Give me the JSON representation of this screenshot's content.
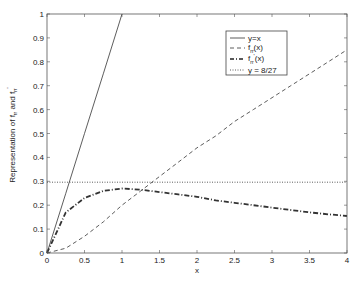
{
  "chart_data": {
    "type": "line",
    "title": "",
    "xlabel": "x",
    "ylabel": "Representation of f_rr and f_rr'",
    "xlim": [
      0,
      4
    ],
    "ylim": [
      0,
      1
    ],
    "xticks": [
      0,
      0.5,
      1,
      1.5,
      2,
      2.5,
      3,
      3.5,
      4
    ],
    "xtick_labels": [
      "0",
      "0.5",
      "1",
      "1.5",
      "2",
      "2.5",
      "3",
      "3.5",
      "4"
    ],
    "yticks": [
      0,
      0.1,
      0.2,
      0.3,
      0.4,
      0.5,
      0.6,
      0.7,
      0.8,
      0.9,
      1
    ],
    "ytick_labels": [
      "0",
      "0.1",
      "0.2",
      "0.3",
      "0.4",
      "0.5",
      "0.6",
      "0.7",
      "0.8",
      "0.9",
      "1"
    ],
    "grid": false,
    "legend_position": "upper right (inside)",
    "x": [
      0,
      0.25,
      0.5,
      0.75,
      1,
      1.25,
      1.5,
      1.75,
      2,
      2.25,
      2.5,
      2.75,
      3,
      3.25,
      3.5,
      3.75,
      4
    ],
    "series": [
      {
        "name": "y=x",
        "style": "solid",
        "values": [
          0,
          0.25,
          0.5,
          0.75,
          1,
          null,
          null,
          null,
          null,
          null,
          null,
          null,
          null,
          null,
          null,
          null,
          null
        ]
      },
      {
        "name": "f_rr(x)",
        "style": "dashed",
        "values": [
          0,
          0.02,
          0.07,
          0.13,
          0.2,
          0.26,
          0.32,
          0.38,
          0.44,
          0.49,
          0.55,
          0.6,
          0.65,
          0.7,
          0.75,
          0.8,
          0.85
        ]
      },
      {
        "name": "f_rr'(x)",
        "style": "dash-dot",
        "values": [
          0,
          0.17,
          0.23,
          0.26,
          0.27,
          0.265,
          0.255,
          0.245,
          0.235,
          0.22,
          0.21,
          0.2,
          0.19,
          0.18,
          0.17,
          0.162,
          0.155
        ]
      },
      {
        "name": "y = 8/27",
        "style": "dotted",
        "values": [
          0.2963,
          0.2963,
          0.2963,
          0.2963,
          0.2963,
          0.2963,
          0.2963,
          0.2963,
          0.2963,
          0.2963,
          0.2963,
          0.2963,
          0.2963,
          0.2963,
          0.2963,
          0.2963,
          0.2963
        ]
      }
    ]
  },
  "legend": {
    "items": [
      {
        "label": "y=x",
        "sub": "",
        "sup": ""
      },
      {
        "label": "f",
        "sub": "rr",
        "sup": "",
        "suffix": "(x)"
      },
      {
        "label": "f",
        "sub": "rr",
        "sup": "'",
        "suffix": "(x)"
      },
      {
        "label": "y = 8/27",
        "sub": "",
        "sup": ""
      }
    ]
  },
  "axes": {
    "xlabel": "x",
    "ylabel_main": "Representation of f",
    "ylabel_sub1": "rr",
    "ylabel_mid": " and f",
    "ylabel_sub2": "rr",
    "ylabel_sup2": "'"
  },
  "colors": {
    "line": "#333333",
    "axis": "#444444",
    "background": "#ffffff"
  }
}
